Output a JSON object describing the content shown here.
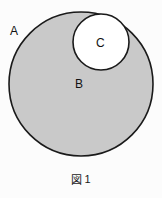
{
  "figure": {
    "caption_glyph": "図",
    "caption_number": "1",
    "caption_full": "図 1",
    "background_color": "#fcfcfc"
  },
  "diagram": {
    "type": "set-diagram",
    "shapes": [
      {
        "id": "outer-circle",
        "shape": "circle",
        "label": "B",
        "cx": 81,
        "cy": 84,
        "r": 72,
        "fill_color": "#c9c9c9",
        "stroke_color": "#1a1a1a",
        "stroke_width": 1.6
      },
      {
        "id": "inner-circle",
        "shape": "circle",
        "label": "C",
        "cx": 101,
        "cy": 42,
        "r": 28,
        "fill_color": "#ffffff",
        "stroke_color": "#1a1a1a",
        "stroke_width": 1.6
      }
    ],
    "labels": [
      {
        "id": "label-a",
        "text": "A",
        "x": 14,
        "y": 31,
        "region": "outside-outer-circle"
      },
      {
        "id": "label-b",
        "text": "B",
        "x": 80,
        "y": 84,
        "region": "inside-outer-circle"
      },
      {
        "id": "label-c",
        "text": "C",
        "x": 101,
        "y": 43,
        "region": "inside-inner-circle"
      }
    ]
  }
}
